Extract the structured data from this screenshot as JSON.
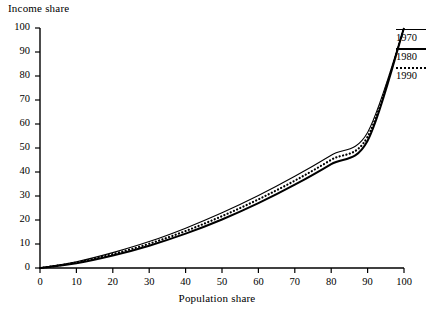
{
  "chart_data": {
    "type": "line",
    "title": "",
    "xlabel": "Population share",
    "ylabel": "Income share",
    "xlim": [
      0,
      100
    ],
    "ylim": [
      0,
      100
    ],
    "xticks": [
      "0",
      "10",
      "20",
      "30",
      "40",
      "50",
      "60",
      "70",
      "80",
      "90",
      "100"
    ],
    "yticks": [
      "0",
      "10",
      "20",
      "30",
      "40",
      "50",
      "60",
      "70",
      "80",
      "90",
      "100"
    ],
    "grid": false,
    "legend_position": "top-right",
    "x": [
      0,
      10,
      20,
      30,
      40,
      50,
      60,
      70,
      80,
      90,
      100
    ],
    "series": [
      {
        "name": "1970",
        "style": "thin-solid",
        "color": "#000000",
        "values": [
          0,
          2.6,
          6.4,
          11.0,
          16.6,
          23.0,
          30.2,
          38.2,
          47.0,
          56.5,
          100
        ]
      },
      {
        "name": "1980",
        "style": "thick-solid",
        "color": "#000000",
        "values": [
          0,
          2.0,
          5.2,
          9.3,
          14.3,
          20.2,
          27.0,
          34.7,
          43.3,
          53.0,
          100
        ]
      },
      {
        "name": "1990",
        "style": "dotted",
        "color": "#000000",
        "values": [
          0,
          2.3,
          5.8,
          10.1,
          15.4,
          21.6,
          28.6,
          36.4,
          45.1,
          54.7,
          100
        ]
      }
    ]
  },
  "axes": {
    "y_title": "Income share",
    "x_title": "Population share"
  },
  "legend": {
    "entries": [
      {
        "label": "1970",
        "style": "thin-solid"
      },
      {
        "label": "1980",
        "style": "thick-solid"
      },
      {
        "label": "1990",
        "style": "dotted"
      }
    ]
  }
}
